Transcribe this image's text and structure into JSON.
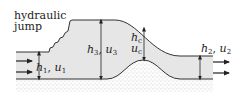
{
  "diagram": {
    "title_label": {
      "line1": "hydraulic",
      "line2": "jump"
    },
    "labels": {
      "h1": {
        "var_h": "h",
        "sub_h": "1",
        "sep": ", ",
        "var_u": "u",
        "sub_u": "1"
      },
      "h3": {
        "var_h": "h",
        "sub_h": "3",
        "sep": ", ",
        "var_u": "u",
        "sub_u": "3"
      },
      "hc": {
        "var_h": "h",
        "sub_h": "c",
        "var_u": "u",
        "sub_u": "c"
      },
      "h2": {
        "var_h": "h",
        "sub_h": "2",
        "sep": ", ",
        "var_u": "u",
        "sub_u": "2"
      }
    },
    "colors": {
      "water_fill": "#e6e6e6",
      "line": "#333333",
      "ground_dots": "#8a8a8a",
      "text": "#222222"
    }
  }
}
